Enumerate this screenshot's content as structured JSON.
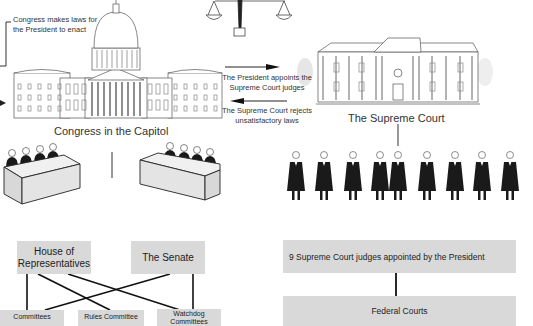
{
  "top": {
    "congress_note_line1": "Congress makes laws for",
    "congress_note_line2": "the President to enact",
    "president_appoints_line1": "The President appoints the",
    "president_appoints_line2": "Supreme Court  judges",
    "court_rejects_line1": "The Supreme Court rejects",
    "court_rejects_line2": "unsatisfactory laws"
  },
  "buildings": {
    "capitol_label": "Congress in the Capitol",
    "court_label": "The Supreme Court"
  },
  "icons": {
    "scales": "scales-of-justice-icon",
    "capitol": "capitol-building-icon",
    "court": "supreme-court-building-icon",
    "desks": "congress-desk-icon",
    "judges": "judge-figure-icon"
  },
  "judges_count": 9,
  "congress_chart": {
    "house": "House of Representatives",
    "house_line1": "House of",
    "house_line2": "Representatives",
    "senate": "The Senate",
    "committees": "Committees",
    "rules_committee": "Rules Committee",
    "watchdog_line1": "Watchdog",
    "watchdog_line2": "Committees"
  },
  "court_chart": {
    "judges_box": "9 Supreme Court judges appointed by the President",
    "federal_courts": "Federal Courts"
  },
  "colors": {
    "box_fill": "#d9d9d9",
    "line": "#111111",
    "robe": "#1a1a1a"
  }
}
